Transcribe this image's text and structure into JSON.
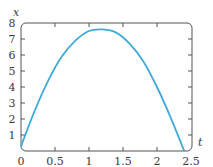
{
  "chart_data": {
    "type": "line",
    "title": "",
    "xlabel": "t",
    "ylabel": "x",
    "xlim": [
      0,
      2.5
    ],
    "ylim": [
      0,
      8
    ],
    "grid": false,
    "legend": null,
    "x_ticks": [
      "0",
      "0.5",
      "1",
      "1.5",
      "2",
      "2.5"
    ],
    "y_ticks": [
      "1",
      "2",
      "3",
      "4",
      "5",
      "6",
      "7",
      "8"
    ],
    "series": [
      {
        "name": "x(t)",
        "color": "#3fa9d8",
        "x": [
          0,
          0.2,
          0.4,
          0.6,
          0.8,
          1.0,
          1.2,
          1.4,
          1.6,
          1.8,
          2.0,
          2.2,
          2.4
        ],
        "y": [
          0.3,
          2.5,
          4.4,
          5.9,
          6.9,
          7.5,
          7.6,
          7.4,
          6.7,
          5.6,
          4.0,
          2.1,
          0.0
        ]
      }
    ]
  },
  "labels": {
    "x_axis_var": "t",
    "y_axis_var": "x",
    "x_ticks": [
      "0",
      "0.5",
      "1",
      "1.5",
      "2",
      "2.5"
    ],
    "y_ticks": [
      "1",
      "2",
      "3",
      "4",
      "5",
      "6",
      "7",
      "8"
    ]
  },
  "colors": {
    "curve": "#3fa9d8",
    "axis": "#555555"
  }
}
